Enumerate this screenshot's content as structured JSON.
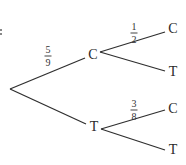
{
  "diagram": {
    "type": "probability-tree",
    "root": {
      "x": 10,
      "y": 89
    },
    "level1": [
      {
        "label": "C",
        "pos": {
          "x": 93,
          "y": 55
        },
        "edge_probability": {
          "numerator": "5",
          "denominator": "9",
          "pos": {
            "x": 48,
            "y": 56
          }
        },
        "children": [
          {
            "label": "C",
            "pos": {
              "x": 173,
              "y": 29
            },
            "edge_probability": {
              "numerator": "1",
              "denominator": "2",
              "pos": {
                "x": 134,
                "y": 33
              }
            }
          },
          {
            "label": "T",
            "pos": {
              "x": 173,
              "y": 72
            },
            "edge_probability": null
          }
        ]
      },
      {
        "label": "T",
        "pos": {
          "x": 94,
          "y": 127
        },
        "edge_probability": null,
        "children": [
          {
            "label": "C",
            "pos": {
              "x": 173,
              "y": 109
            },
            "edge_probability": {
              "numerator": "3",
              "denominator": "8",
              "pos": {
                "x": 134,
                "y": 110
              }
            }
          },
          {
            "label": "T",
            "pos": {
              "x": 173,
              "y": 150
            },
            "edge_probability": null
          }
        ]
      }
    ]
  }
}
